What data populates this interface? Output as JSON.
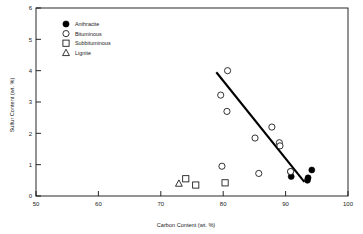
{
  "chart_data": {
    "type": "scatter",
    "title": "",
    "xlabel": "Carbon Content (wt. %)",
    "ylabel": "Sulfur Content (wt. %)",
    "xlim": [
      50,
      100
    ],
    "ylim": [
      0,
      6
    ],
    "xticks": [
      50,
      60,
      70,
      80,
      90,
      100
    ],
    "yticks": [
      0,
      1,
      2,
      3,
      4,
      5,
      6
    ],
    "xtick_labels": [
      "50",
      "60",
      "70",
      "80",
      "90",
      "100"
    ],
    "ytick_labels": [
      "0",
      "1",
      "2",
      "3",
      "4",
      "5",
      "6"
    ],
    "grid": false,
    "legend_position": "upper-left",
    "series": [
      {
        "name": "Anthracite",
        "marker": "filled-circle",
        "color": "#000000",
        "points": [
          {
            "x": 90.8,
            "y": 0.78
          },
          {
            "x": 90.9,
            "y": 0.62
          },
          {
            "x": 93.6,
            "y": 0.58
          },
          {
            "x": 93.5,
            "y": 0.5
          },
          {
            "x": 94.2,
            "y": 0.83
          }
        ]
      },
      {
        "name": "Bituminous",
        "marker": "open-circle",
        "color": "#000000",
        "points": [
          {
            "x": 80.7,
            "y": 4.0
          },
          {
            "x": 79.6,
            "y": 3.22
          },
          {
            "x": 80.6,
            "y": 2.7
          },
          {
            "x": 87.8,
            "y": 2.2
          },
          {
            "x": 85.1,
            "y": 1.85
          },
          {
            "x": 89.0,
            "y": 1.7
          },
          {
            "x": 89.1,
            "y": 1.6
          },
          {
            "x": 79.8,
            "y": 0.95
          },
          {
            "x": 85.7,
            "y": 0.72
          },
          {
            "x": 90.8,
            "y": 0.78
          }
        ]
      },
      {
        "name": "Subbituminous",
        "marker": "open-square",
        "color": "#000000",
        "points": [
          {
            "x": 74.0,
            "y": 0.55
          },
          {
            "x": 75.6,
            "y": 0.35
          },
          {
            "x": 80.3,
            "y": 0.42
          }
        ]
      },
      {
        "name": "Lignite",
        "marker": "open-triangle",
        "color": "#000000",
        "points": [
          {
            "x": 72.9,
            "y": 0.4
          }
        ]
      }
    ],
    "trend_line": {
      "x_start": 78.9,
      "y_start": 3.95,
      "x_end": 93.0,
      "y_end": 0.45
    }
  },
  "legend": {
    "entries": [
      {
        "label": "Anthracite",
        "marker": "filled-circle"
      },
      {
        "label": "Bituminous",
        "marker": "open-circle"
      },
      {
        "label": "Subbituminous",
        "marker": "open-square"
      },
      {
        "label": "Lignite",
        "marker": "open-triangle"
      }
    ]
  }
}
